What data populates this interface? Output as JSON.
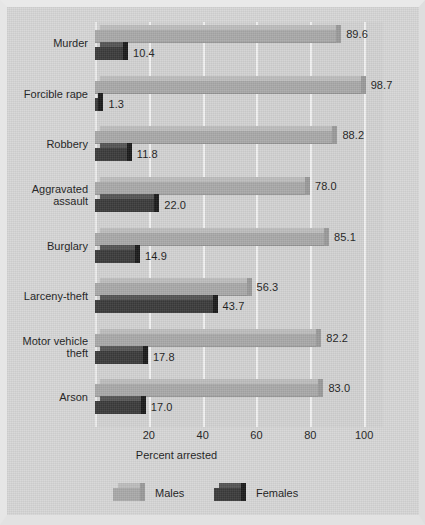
{
  "chart_data": {
    "type": "bar",
    "orientation": "horizontal",
    "title": "",
    "xlabel": "Percent arrested",
    "ylabel": "",
    "xlim": [
      0,
      107
    ],
    "xticks": [
      20,
      40,
      60,
      80,
      100
    ],
    "xtick_labels": [
      "20",
      "40",
      "60",
      "80",
      "100"
    ],
    "grid": true,
    "legend_position": "bottom",
    "categories": [
      "Murder",
      "Forcible rape",
      "Robbery",
      "Aggravated\nassault",
      "Burglary",
      "Larceny-theft",
      "Motor vehicle\ntheft",
      "Arson"
    ],
    "series": [
      {
        "name": "Males",
        "color": "#a9a9a9",
        "values": [
          89.6,
          98.7,
          88.2,
          78.0,
          85.1,
          56.3,
          82.2,
          83.0
        ],
        "value_labels": [
          "89.6",
          "98.7",
          "88.2",
          "78.0",
          "85.1",
          "56.3",
          "82.2",
          "83.0"
        ]
      },
      {
        "name": "Females",
        "color": "#3b3b3b",
        "values": [
          10.4,
          1.3,
          11.8,
          22.0,
          14.9,
          43.7,
          17.8,
          17.0
        ],
        "value_labels": [
          "10.4",
          "1.3",
          "11.8",
          "22.0",
          "14.9",
          "43.7",
          "17.8",
          "17.0"
        ]
      }
    ]
  },
  "legend": {
    "items": [
      {
        "label": "Males",
        "swatch": "males-swatch"
      },
      {
        "label": "Females",
        "swatch": "females-swatch"
      }
    ]
  },
  "axis": {
    "x_title": "Percent arrested"
  }
}
